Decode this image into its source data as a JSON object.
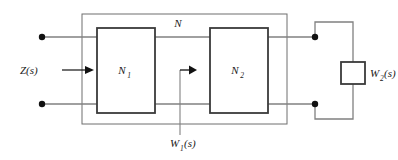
{
  "diagram": {
    "type": "circuit-block-diagram",
    "colors": {
      "background": "#ffffff",
      "wire": "#808080",
      "block_border": "#3a3a3a",
      "outer_border": "#6e6e6e",
      "terminal_dot": "#111111",
      "label_text": "#1a1a1a",
      "arrow": "#111111"
    },
    "labels": {
      "input_impedance": "Z(s)",
      "outer_network": "N",
      "block_1": "N",
      "block_1_sub": "1",
      "block_2": "N",
      "block_2_sub": "2",
      "internal_signal": "W",
      "internal_signal_sub": "1",
      "internal_signal_arg": "(s)",
      "load": "W",
      "load_sub": "2",
      "load_arg": "(s)"
    },
    "blocks": [
      {
        "name": "N1",
        "label": "N",
        "subscript": "1",
        "x": 97,
        "y": 28,
        "width": 58,
        "height": 85
      },
      {
        "name": "N2",
        "label": "N",
        "subscript": "2",
        "x": 210,
        "y": 28,
        "width": 58,
        "height": 85
      },
      {
        "name": "W2",
        "label": "W",
        "subscript": "2",
        "x": 341,
        "y": 62,
        "width": 24,
        "height": 22
      }
    ],
    "outer_box": {
      "name": "N",
      "x": 82,
      "y": 14,
      "width": 205,
      "height": 110
    },
    "terminals": [
      {
        "name": "input-top",
        "x": 42,
        "y": 37
      },
      {
        "name": "input-bottom",
        "x": 42,
        "y": 104
      },
      {
        "name": "output-top",
        "x": 315,
        "y": 37
      },
      {
        "name": "output-bottom",
        "x": 315,
        "y": 104
      }
    ],
    "arrows": [
      {
        "name": "z-arrow",
        "from_x": 64,
        "from_y": 70,
        "to_x": 95,
        "to_y": 70,
        "direction": "right"
      },
      {
        "name": "w1-arrow",
        "from_x": 180,
        "from_y": 70,
        "to_x": 196,
        "to_y": 70,
        "direction": "right"
      }
    ],
    "wires": {
      "top_rail_y": 37,
      "bottom_rail_y": 104,
      "w1_tap_x": 180,
      "w1_tap_bottom_y": 135,
      "load_loop_x": 353,
      "load_loop_top_y": 22,
      "load_loop_bottom_y": 119
    }
  }
}
